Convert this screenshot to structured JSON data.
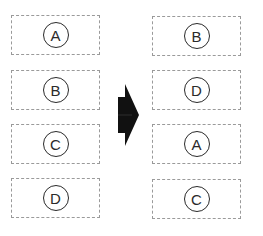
{
  "diagram": {
    "left_column": {
      "items": [
        {
          "label": "A"
        },
        {
          "label": "B"
        },
        {
          "label": "C"
        },
        {
          "label": "D"
        }
      ]
    },
    "arrow": {
      "direction": "right",
      "icon": "block-arrow-right-icon",
      "color": "#111111"
    },
    "right_column": {
      "items": [
        {
          "label": "B"
        },
        {
          "label": "D"
        },
        {
          "label": "A"
        },
        {
          "label": "C"
        }
      ]
    },
    "colors": {
      "box_border": "#9a9a9a",
      "circle_border": "#2a2a2a",
      "text": "#2a2a2a",
      "background": "#ffffff"
    }
  }
}
